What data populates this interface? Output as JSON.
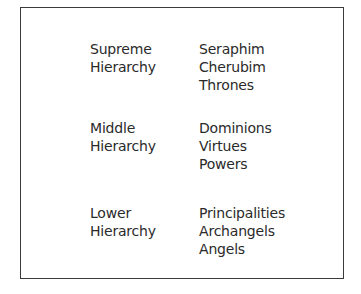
{
  "hierarchies": [
    {
      "label_lines": [
        "Supreme",
        "Hierarchy"
      ],
      "members": [
        "Seraphim",
        "Cherubim",
        "Thrones"
      ]
    },
    {
      "label_lines": [
        "Middle",
        "Hierarchy"
      ],
      "members": [
        "Dominions",
        "Virtues",
        "Powers"
      ]
    },
    {
      "label_lines": [
        "Lower",
        "Hierarchy"
      ],
      "members": [
        "Principalities",
        "Archangels",
        "Angels"
      ]
    }
  ],
  "colors": {
    "text": "#2a2a2a",
    "border": "#3a3a3a",
    "background": "#ffffff"
  }
}
